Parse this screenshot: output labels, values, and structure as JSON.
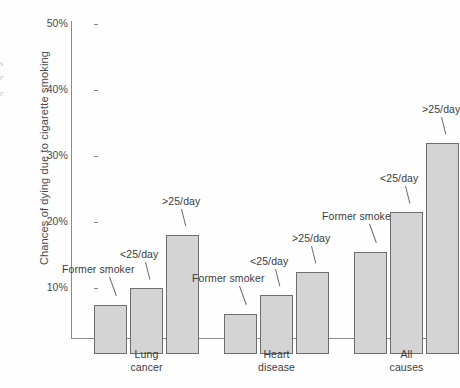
{
  "margin_scraps": [
    {
      "text": "s",
      "top": 58
    },
    {
      "text": "r",
      "top": 72
    },
    {
      "text": "r.",
      "top": 88
    }
  ],
  "chart_data": {
    "type": "bar",
    "title": "",
    "xlabel": "",
    "ylabel": "Chances of dying due to cigarette smoking",
    "ylim": [
      0,
      50
    ],
    "yticks": [
      "10%",
      "20%",
      "30%",
      "40%",
      "50%"
    ],
    "ytick_values": [
      10,
      20,
      30,
      40,
      50
    ],
    "grid": false,
    "legend": "none",
    "categories": [
      "Lung cancer",
      "Heart disease",
      "All causes"
    ],
    "category_lines": [
      [
        "Lung",
        "cancer"
      ],
      [
        "Heart",
        "disease"
      ],
      [
        "All",
        "causes"
      ]
    ],
    "series": [
      {
        "name": "Former smoker",
        "values": [
          7.5,
          6.0,
          15.5
        ]
      },
      {
        "name": "<25/day",
        "values": [
          10.0,
          9.0,
          21.5
        ]
      },
      {
        "name": ">25/day",
        "values": [
          18.0,
          12.5,
          32.0
        ]
      }
    ],
    "bars": [
      {
        "group": "Lung cancer",
        "label": "Former smoker",
        "value": 7.5
      },
      {
        "group": "Lung cancer",
        "label": "<25/day",
        "value": 10.0
      },
      {
        "group": "Lung cancer",
        "label": ">25/day",
        "value": 18.0
      },
      {
        "group": "Heart disease",
        "label": "Former smoker",
        "value": 6.0
      },
      {
        "group": "Heart disease",
        "label": "<25/day",
        "value": 9.0
      },
      {
        "group": "Heart disease",
        "label": ">25/day",
        "value": 12.5
      },
      {
        "group": "All causes",
        "label": "Former smoker",
        "value": 15.5
      },
      {
        "group": "All causes",
        "label": "<25/day",
        "value": 21.5
      },
      {
        "group": "All causes",
        "label": ">25/day",
        "value": 32.0
      }
    ],
    "colors": {
      "bar_fill": "#d4d4d4",
      "bar_border": "#6e6e6e",
      "axis": "#8a8a8a",
      "text": "#3c3c3c"
    }
  }
}
